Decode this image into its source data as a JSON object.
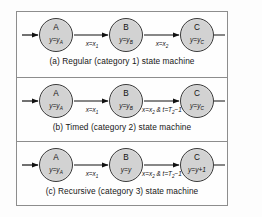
{
  "figure": {
    "colors": {
      "node_fill": "#d2d2d2",
      "node_stroke": "#3a3a3a",
      "frame_border": "#8d8d8d",
      "background": "#fdfdfd",
      "text": "#111111"
    },
    "panels": [
      {
        "id": "a",
        "caption": "(a) Regular (category 1) state machine",
        "states": [
          {
            "name": "A",
            "value_html": "y=y<sub>A</sub>",
            "value": "y=yA"
          },
          {
            "name": "B",
            "value_html": "y=y<sub>B</sub>",
            "value": "y=yB"
          },
          {
            "name": "C",
            "value_html": "y=y<sub>C</sub>",
            "value": "y=yC"
          }
        ],
        "transitions": [
          {
            "from": "A",
            "to": "B",
            "label_html": "x=x<sub>1</sub>",
            "label": "x=x1"
          },
          {
            "from": "B",
            "to": "C",
            "label_html": "x=x<sub>2</sub>",
            "label": "x=x2"
          }
        ],
        "has_entry_arrow": true,
        "has_exit_line": true
      },
      {
        "id": "b",
        "caption": "(b) Timed (category 2) state machine",
        "states": [
          {
            "name": "A",
            "value_html": "y=y<sub>A</sub>",
            "value": "y=yA"
          },
          {
            "name": "B",
            "value_html": "y=y<sub>B</sub>",
            "value": "y=yB"
          },
          {
            "name": "C",
            "value_html": "y=y<sub>C</sub>",
            "value": "y=yC"
          }
        ],
        "transitions": [
          {
            "from": "A",
            "to": "B",
            "label_html": "x=x<sub>1</sub>",
            "label": "x=x1"
          },
          {
            "from": "B",
            "to": "C",
            "label_html": "x=x<sub>2</sub> &amp; t=T<sub>2</sub>&minus;1",
            "label": "x=x2 & t=T2-1"
          }
        ],
        "has_entry_arrow": true,
        "has_exit_line": true
      },
      {
        "id": "c",
        "caption": "(c) Recursive (category 3) state machine",
        "states": [
          {
            "name": "A",
            "value_html": "y=y<sub>A</sub>",
            "value": "y=yA"
          },
          {
            "name": "B",
            "value_html": "y=y",
            "value": "y=y"
          },
          {
            "name": "C",
            "value_html": "y=y+1",
            "value": "y=y+1"
          }
        ],
        "transitions": [
          {
            "from": "A",
            "to": "B",
            "label_html": "x=x<sub>1</sub>",
            "label": "x=x1"
          },
          {
            "from": "B",
            "to": "C",
            "label_html": "x=x<sub>2</sub> &amp; t=T<sub>2</sub>&minus;1",
            "label": "x=x2 & t=T2-1"
          }
        ],
        "has_entry_arrow": true,
        "has_exit_line": true
      }
    ]
  }
}
